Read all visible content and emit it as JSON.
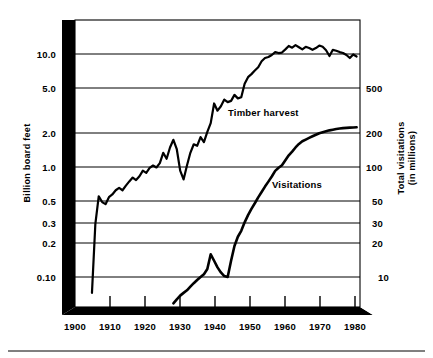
{
  "figure": {
    "background_color": "#ffffff",
    "ink_color": "#000000",
    "gridline_color": "#000000",
    "has_bottom_rule": true
  },
  "chart_data": {
    "type": "line",
    "title": "",
    "subtitle": "",
    "xlabel": "",
    "ylabel": "Billion board feet",
    "y2label": "Total visitations (in millions)",
    "grid": true,
    "legend_position": "inline-annotation",
    "x_axis": {
      "ticks": [
        1900,
        1910,
        1920,
        1930,
        1940,
        1950,
        1960,
        1970,
        1980
      ],
      "tick_labels": [
        "1900",
        "1910",
        "1920",
        "1930",
        "1940",
        "1950",
        "1960",
        "1970",
        "1980"
      ],
      "xlim": [
        1900,
        1984
      ]
    },
    "y_axis_left": {
      "scale": "log",
      "label": "Billion board feet",
      "ticks": [
        10.0,
        5.0,
        2.0,
        1.0,
        0.5,
        0.3,
        0.2,
        0.1
      ],
      "tick_labels": [
        "10.0",
        "5.0",
        "2.0",
        "1.0",
        "0.5",
        "0.3",
        "0.2",
        "0.10"
      ],
      "ylim": [
        0.055,
        16.5
      ]
    },
    "y_axis_right": {
      "scale": "log",
      "label": "Total visitations (in millions)",
      "ticks": [
        500,
        200,
        100,
        50,
        30,
        20,
        10
      ],
      "tick_labels": [
        "500",
        "200",
        "100",
        "50",
        "30",
        "20",
        "10"
      ],
      "ylim": [
        5.5,
        1650
      ]
    },
    "series": [
      {
        "name": "Timber harvest",
        "axis": "left",
        "units": "billion board feet",
        "annotation": "Timber harvest",
        "annotation_x": 1941,
        "annotation_y": 3.1,
        "x": [
          1905,
          1906,
          1907,
          1908,
          1909,
          1910,
          1911,
          1912,
          1913,
          1914,
          1915,
          1916,
          1917,
          1918,
          1919,
          1920,
          1921,
          1922,
          1923,
          1924,
          1925,
          1926,
          1927,
          1928,
          1929,
          1930,
          1931,
          1932,
          1933,
          1934,
          1935,
          1936,
          1937,
          1938,
          1939,
          1940,
          1941,
          1942,
          1943,
          1944,
          1945,
          1946,
          1947,
          1948,
          1949,
          1950,
          1951,
          1952,
          1953,
          1954,
          1955,
          1956,
          1957,
          1958,
          1959,
          1960,
          1961,
          1962,
          1963,
          1964,
          1965,
          1966,
          1967,
          1968,
          1969,
          1970,
          1971,
          1972,
          1973,
          1974,
          1975,
          1976,
          1977,
          1978,
          1979,
          1980,
          1981,
          1982,
          1983
        ],
        "values": [
          0.072,
          0.3,
          0.53,
          0.47,
          0.45,
          0.52,
          0.55,
          0.6,
          0.63,
          0.6,
          0.66,
          0.72,
          0.78,
          0.74,
          0.8,
          0.9,
          0.86,
          0.95,
          1.0,
          0.96,
          1.05,
          1.3,
          1.15,
          1.45,
          1.7,
          1.4,
          0.9,
          0.75,
          1.0,
          1.3,
          1.55,
          1.5,
          1.8,
          1.62,
          2.0,
          2.4,
          3.6,
          3.1,
          3.4,
          3.9,
          3.7,
          3.8,
          4.3,
          4.0,
          4.1,
          5.4,
          6.2,
          6.6,
          7.1,
          7.6,
          8.6,
          9.2,
          9.4,
          9.8,
          10.4,
          10.2,
          10.3,
          11.0,
          11.8,
          11.4,
          12.0,
          11.5,
          11.0,
          11.6,
          11.3,
          10.9,
          11.3,
          11.9,
          11.6,
          10.8,
          9.6,
          10.9,
          10.7,
          10.4,
          10.2,
          9.8,
          9.2,
          9.9,
          9.5
        ]
      },
      {
        "name": "Visitations",
        "axis": "right",
        "units": "millions of visits",
        "annotation": "Visitations",
        "annotation_x": 1964,
        "annotation_y": 62,
        "x": [
          1929,
          1930,
          1931,
          1932,
          1933,
          1934,
          1935,
          1936,
          1937,
          1938,
          1939,
          1940,
          1941,
          1942,
          1943,
          1944,
          1945,
          1946,
          1947,
          1948,
          1949,
          1950,
          1951,
          1952,
          1953,
          1954,
          1955,
          1956,
          1957,
          1958,
          1959,
          1960,
          1961,
          1962,
          1963,
          1964,
          1965,
          1966,
          1967,
          1968,
          1969,
          1970,
          1971,
          1972,
          1973,
          1974,
          1975,
          1976,
          1977,
          1978,
          1979,
          1980,
          1981,
          1982,
          1983
        ],
        "values": [
          5.8,
          6.3,
          6.8,
          7.2,
          7.6,
          8.2,
          8.8,
          9.4,
          10.0,
          10.6,
          11.8,
          16.0,
          14.0,
          12.2,
          11.0,
          10.2,
          10.0,
          14.0,
          19.0,
          23.0,
          26.0,
          31.0,
          36.0,
          41.0,
          46.0,
          52.0,
          58.0,
          65.0,
          72.0,
          80.0,
          90.0,
          96.0,
          101,
          112,
          124,
          134,
          146,
          157,
          166,
          172,
          178,
          184,
          190,
          196,
          200,
          204,
          208,
          211,
          214,
          216,
          218,
          219,
          220,
          221,
          222
        ]
      }
    ]
  },
  "annotations": {
    "timber_label": "Timber harvest",
    "visitations_label": "Visitations",
    "y_left_title": "Billion board feet",
    "y_right_title_line1": "Total visitations",
    "y_right_title_line2": "(in millions)"
  }
}
